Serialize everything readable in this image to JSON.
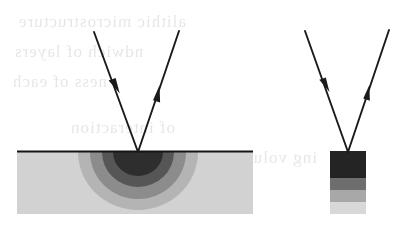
{
  "figure": {
    "caption": "",
    "canvas": {
      "width": 408,
      "height": 233,
      "background": "#ffffff"
    }
  },
  "colors": {
    "line": "#1a1a1a",
    "arrow_fill": "#1a1a1a",
    "surface_line": "#141414",
    "bulk_matrix": "#d2d2d2",
    "zone_1_darkest": "#2e2e2e",
    "zone_2_dark": "#565656",
    "zone_3_mid": "#8c8c8c",
    "zone_4_light": "#b4b4b4",
    "band_1_darkest": "#242424",
    "band_2_dark": "#6e6e6e",
    "band_3_mid": "#a8a8a8",
    "band_4_light": "#d8d8d8",
    "background": "#ffffff",
    "ghost_text": "#cfcfcf"
  },
  "panels": [
    {
      "id": "bulk-specimen-panel",
      "name": "Bulk specimen with hemispherical interaction volume",
      "surface": {
        "x1": 17,
        "y1": 151.5,
        "x2": 253,
        "y2": 151.5,
        "stroke_width": 2.2
      },
      "substrate": {
        "x": 17,
        "y": 152,
        "width": 236,
        "height": 62,
        "fill": "#d2d2d2",
        "label": "matrix"
      },
      "impact_point": {
        "x": 138,
        "y": 152
      },
      "interaction_zones": [
        {
          "name": "outer-scatter-zone",
          "rx": 60,
          "ry": 58,
          "fill": "#b4b4b4",
          "order": 4
        },
        {
          "name": "mid-scatter-zone",
          "rx": 48,
          "ry": 47,
          "fill": "#8c8c8c",
          "order": 3
        },
        {
          "name": "inner-scatter-zone",
          "rx": 36,
          "ry": 35,
          "fill": "#565656",
          "order": 2
        },
        {
          "name": "core-scatter-zone",
          "rx": 25,
          "ry": 24,
          "fill": "#2e2e2e",
          "order": 1
        }
      ],
      "beams": {
        "incident": {
          "name": "incident-beam",
          "from": {
            "x": 94,
            "y": 32
          },
          "to": {
            "x": 138,
            "y": 152
          },
          "arrowhead": {
            "x": 117,
            "y": 86,
            "direction": "down-right",
            "size": 13
          }
        },
        "emergent": {
          "name": "emergent-beam",
          "from": {
            "x": 138,
            "y": 152
          },
          "to": {
            "x": 179,
            "y": 31
          },
          "arrowhead": {
            "x": 157,
            "y": 93,
            "direction": "up-right",
            "size": 13
          }
        }
      }
    },
    {
      "id": "thin-film-panel",
      "name": "Confined specimen with layered interaction bands",
      "impact_point": {
        "x": 348,
        "y": 152
      },
      "block": {
        "x": 330,
        "y": 151,
        "width": 36,
        "height": 63
      },
      "layers": [
        {
          "name": "layer-1-darkest",
          "y": 151,
          "height": 27,
          "fill": "#242424"
        },
        {
          "name": "layer-2-dark",
          "y": 178,
          "height": 12,
          "fill": "#6e6e6e"
        },
        {
          "name": "layer-3-mid",
          "y": 190,
          "height": 12,
          "fill": "#a8a8a8"
        },
        {
          "name": "layer-4-light",
          "y": 202,
          "height": 12,
          "fill": "#d8d8d8"
        }
      ],
      "beams": {
        "incident": {
          "name": "incident-beam",
          "from": {
            "x": 305,
            "y": 31
          },
          "to": {
            "x": 348,
            "y": 152
          },
          "arrowhead": {
            "x": 327,
            "y": 85,
            "direction": "down-right",
            "size": 12
          }
        },
        "emergent": {
          "name": "emergent-beam",
          "from": {
            "x": 348,
            "y": 152
          },
          "to": {
            "x": 389,
            "y": 30
          },
          "arrowhead": {
            "x": 367,
            "y": 92,
            "direction": "up-right",
            "size": 12
          }
        }
      }
    }
  ],
  "scan_artifacts": {
    "description": "faint reverse-side text bleed-through from scanned page",
    "ghost_lines": [
      {
        "text": "alithic microstructure",
        "x": 18,
        "y": 12,
        "size": 17
      },
      {
        "text": "ndwich of layers",
        "x": 14,
        "y": 42,
        "size": 17
      },
      {
        "text": "ness of each",
        "x": 12,
        "y": 72,
        "size": 17
      },
      {
        "text": "of interaction",
        "x": 70,
        "y": 118,
        "size": 17
      },
      {
        "text": "ing volume",
        "x": 230,
        "y": 148,
        "size": 17
      }
    ]
  }
}
